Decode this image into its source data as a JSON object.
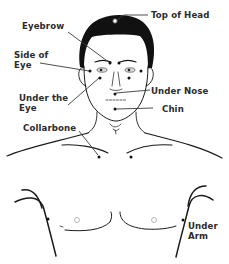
{
  "diagram": {
    "labels": {
      "top_of_head": "Top of Head",
      "eyebrow": "Eyebrow",
      "side_of_eye": "Side of\nEye",
      "under_the_eye": "Under the\nEye",
      "under_nose": "Under Nose",
      "chin": "Chin",
      "collarbone": "Collarbone",
      "under_arm": "Under\nArm"
    },
    "colors": {
      "ink": "#1a1a1a",
      "label_text": "#2b2b2b",
      "background": "#ffffff"
    }
  }
}
